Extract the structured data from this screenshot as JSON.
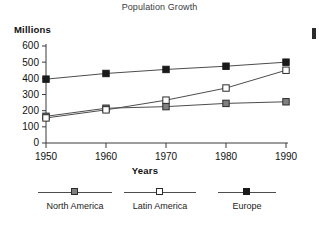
{
  "chart_data": {
    "type": "line",
    "title": "Population Growth",
    "xlabel": "Years",
    "ylabel": "Millions",
    "categories": [
      "1950",
      "1960",
      "1970",
      "1980",
      "1990"
    ],
    "x": [
      1950,
      1960,
      1970,
      1980,
      1990
    ],
    "xlim": [
      1950,
      1990
    ],
    "ylim": [
      0,
      600
    ],
    "yticks": [
      0,
      100,
      200,
      300,
      400,
      500,
      600
    ],
    "ytick_labels": [
      "0",
      "100",
      "200",
      "300",
      "400",
      "500",
      "600"
    ],
    "xticks": [
      1950,
      1960,
      1970,
      1980,
      1990
    ],
    "xtick_labels": [
      "1950",
      "1960",
      "1970",
      "1980",
      "1990"
    ],
    "grid": false,
    "legend_position": "bottom",
    "series": [
      {
        "name": "North America",
        "marker": "filled-square",
        "color": "#808080",
        "edge_color": "#2b2b2b",
        "line_color": "#4d4d4d",
        "values": [
          165,
          215,
          225,
          245,
          255
        ]
      },
      {
        "name": "Latin America",
        "marker": "open-square",
        "color": "#ffffff",
        "edge_color": "#2b2b2b",
        "line_color": "#4d4d4d",
        "values": [
          155,
          205,
          265,
          340,
          450
        ]
      },
      {
        "name": "Europe",
        "marker": "filled-square",
        "color": "#1a1a1a",
        "edge_color": "#1a1a1a",
        "line_color": "#4d4d4d",
        "values": [
          395,
          430,
          455,
          475,
          500
        ]
      }
    ]
  },
  "legend": {
    "items": [
      {
        "label": "North America"
      },
      {
        "label": "Latin America"
      },
      {
        "label": "Europe"
      }
    ]
  },
  "axes": {
    "y_tick_0": "0",
    "y_tick_1": "100",
    "y_tick_2": "200",
    "y_tick_3": "300",
    "y_tick_4": "400",
    "y_tick_5": "500",
    "y_tick_6": "600",
    "x_tick_0": "1950",
    "x_tick_1": "1960",
    "x_tick_2": "1970",
    "x_tick_3": "1980",
    "x_tick_4": "1990"
  }
}
